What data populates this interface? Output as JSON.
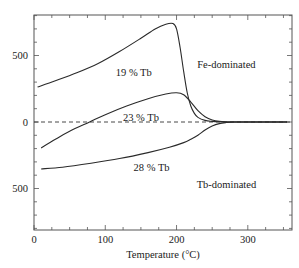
{
  "chart_data": {
    "type": "line",
    "title": "",
    "xlabel": "Temperature (°C)",
    "ylabel": "",
    "xlim": [
      0,
      360
    ],
    "ylim": [
      -800,
      800
    ],
    "grid": false,
    "legend": "none (inline curve labels)",
    "x_ticks": [
      0,
      100,
      200,
      300
    ],
    "x_tick_labels": [
      "0",
      "100",
      "200",
      "300"
    ],
    "y_ticks": [
      500,
      0,
      -500
    ],
    "y_tick_labels": [
      "500",
      "0",
      "500"
    ],
    "zero_line": {
      "value": 0,
      "style": "dashed"
    },
    "annotations": [
      {
        "text": "Fe-dominated",
        "x": 270,
        "y": 430
      },
      {
        "text": "Tb-dominated",
        "x": 270,
        "y": -470
      }
    ],
    "series": [
      {
        "name": "19 % Tb",
        "label_pos": {
          "x": 140,
          "y": 370
        },
        "x": [
          5,
          30,
          60,
          90,
          120,
          150,
          170,
          185,
          195,
          200,
          205,
          210,
          215,
          220,
          225,
          230,
          240,
          250,
          260,
          280,
          300,
          330,
          355
        ],
        "y": [
          263,
          310,
          370,
          440,
          530,
          630,
          700,
          735,
          740,
          700,
          560,
          380,
          220,
          120,
          65,
          35,
          12,
          5,
          2,
          0,
          0,
          0,
          0
        ]
      },
      {
        "name": "23 % Tb",
        "label_pos": {
          "x": 150,
          "y": 35
        },
        "x": [
          10,
          30,
          50,
          78,
          100,
          130,
          160,
          185,
          200,
          210,
          220,
          230,
          240,
          250,
          260,
          280,
          300,
          330,
          355
        ],
        "y": [
          -195,
          -130,
          -70,
          0,
          55,
          120,
          175,
          210,
          220,
          205,
          150,
          85,
          40,
          15,
          5,
          0,
          0,
          0,
          0
        ]
      },
      {
        "name": "28 % Tb",
        "label_pos": {
          "x": 165,
          "y": -340
        },
        "x": [
          10,
          40,
          80,
          120,
          160,
          190,
          210,
          220,
          230,
          240,
          250,
          260,
          270,
          280,
          300,
          330,
          355
        ],
        "y": [
          -353,
          -340,
          -310,
          -275,
          -230,
          -190,
          -155,
          -130,
          -100,
          -60,
          -30,
          -12,
          -4,
          0,
          0,
          0,
          0
        ]
      }
    ]
  }
}
